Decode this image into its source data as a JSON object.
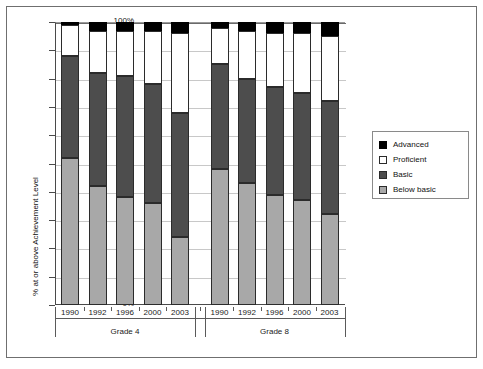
{
  "chart_data": {
    "type": "bar",
    "subtype": "stacked-100-percent",
    "title": "",
    "xlabel": "",
    "ylabel": "% at or above Achievement Level",
    "ylim": [
      0,
      100
    ],
    "ytick_labels": [
      "0%",
      "10%",
      "20%",
      "30%",
      "40%",
      "50%",
      "60%",
      "70%",
      "80%",
      "90%",
      "100%"
    ],
    "ytick_values": [
      0,
      10,
      20,
      30,
      40,
      50,
      60,
      70,
      80,
      90,
      100
    ],
    "grid": true,
    "legend_position": "right",
    "groups": [
      {
        "name": "Grade 4",
        "categories": [
          "1990",
          "1992",
          "1996",
          "2000",
          "2003"
        ]
      },
      {
        "name": "Grade 8",
        "categories": [
          "1990",
          "1992",
          "1996",
          "2000",
          "2003"
        ]
      }
    ],
    "categories": [
      "1990",
      "1992",
      "1996",
      "2000",
      "2003",
      "1990",
      "1992",
      "1996",
      "2000",
      "2003"
    ],
    "series": [
      {
        "name": "Below basic",
        "color": "#a8a8a8",
        "values": [
          52,
          42,
          38,
          36,
          24,
          48,
          43,
          39,
          37,
          32
        ]
      },
      {
        "name": "Basic",
        "color": "#4d4d4d",
        "values": [
          36,
          40,
          43,
          42,
          44,
          37,
          37,
          38,
          38,
          40
        ]
      },
      {
        "name": "Proficient",
        "color": "#ffffff",
        "values": [
          11,
          15,
          16,
          19,
          28,
          13,
          17,
          19,
          21,
          23
        ]
      },
      {
        "name": "Advanced",
        "color": "#000000",
        "values": [
          1,
          3,
          3,
          3,
          4,
          2,
          3,
          4,
          4,
          5
        ]
      }
    ],
    "bars": [
      {
        "group": "Grade 4",
        "year": "1990",
        "below_basic": 52,
        "basic": 36,
        "proficient": 11,
        "advanced": 1
      },
      {
        "group": "Grade 4",
        "year": "1992",
        "below_basic": 42,
        "basic": 40,
        "proficient": 15,
        "advanced": 3
      },
      {
        "group": "Grade 4",
        "year": "1996",
        "below_basic": 38,
        "basic": 43,
        "proficient": 16,
        "advanced": 3
      },
      {
        "group": "Grade 4",
        "year": "2000",
        "below_basic": 36,
        "basic": 42,
        "proficient": 19,
        "advanced": 3
      },
      {
        "group": "Grade 4",
        "year": "2003",
        "below_basic": 24,
        "basic": 44,
        "proficient": 28,
        "advanced": 4
      },
      {
        "group": "Grade 8",
        "year": "1990",
        "below_basic": 48,
        "basic": 37,
        "proficient": 13,
        "advanced": 2
      },
      {
        "group": "Grade 8",
        "year": "1992",
        "below_basic": 43,
        "basic": 37,
        "proficient": 17,
        "advanced": 3
      },
      {
        "group": "Grade 8",
        "year": "1996",
        "below_basic": 39,
        "basic": 38,
        "proficient": 19,
        "advanced": 4
      },
      {
        "group": "Grade 8",
        "year": "2000",
        "below_basic": 37,
        "basic": 38,
        "proficient": 21,
        "advanced": 4
      },
      {
        "group": "Grade 8",
        "year": "2003",
        "below_basic": 32,
        "basic": 40,
        "proficient": 23,
        "advanced": 5
      }
    ],
    "legend": [
      {
        "label": "Advanced",
        "key": "advanced",
        "color": "#000000"
      },
      {
        "label": "Proficient",
        "key": "proficient",
        "color": "#ffffff"
      },
      {
        "label": "Basic",
        "key": "basic",
        "color": "#4d4d4d"
      },
      {
        "label": "Below basic",
        "key": "belowbasic",
        "color": "#a8a8a8"
      }
    ]
  }
}
